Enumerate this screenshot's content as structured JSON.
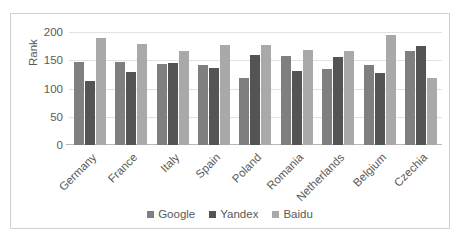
{
  "chart_data": {
    "type": "bar",
    "title": "",
    "subtitle": "",
    "xlabel": "",
    "ylabel": "Rank",
    "ylim": [
      0,
      200
    ],
    "yticks": [
      0,
      50,
      100,
      150,
      200
    ],
    "grid": true,
    "legend_position": "bottom",
    "categories": [
      "Germany",
      "France",
      "Italy",
      "Spain",
      "Poland",
      "Romania",
      "Netherlands",
      "Belgium",
      "Czechia"
    ],
    "series": [
      {
        "name": "Google",
        "color": "#7f7f7f",
        "values": [
          147,
          147,
          143,
          142,
          119,
          158,
          135,
          141,
          167
        ]
      },
      {
        "name": "Yandex",
        "color": "#545454",
        "values": [
          114,
          130,
          145,
          136,
          159,
          131,
          155,
          128,
          176
        ]
      },
      {
        "name": "Baidu",
        "color": "#a9a9a9",
        "values": [
          190,
          178,
          166,
          177,
          177,
          168,
          167,
          194,
          119
        ]
      }
    ]
  },
  "axis": {
    "y_title": "Rank",
    "y_tick_labels": [
      "200",
      "150",
      "100",
      "50",
      "0"
    ]
  },
  "legend": {
    "items": [
      {
        "label": "Google",
        "color": "#7f7f7f"
      },
      {
        "label": "Yandex",
        "color": "#545454"
      },
      {
        "label": "Baidu",
        "color": "#a9a9a9"
      }
    ]
  },
  "colors": {
    "gridline": "#e2e2e2",
    "axis": "#b8b8b8",
    "text": "#595959",
    "frame": "#d0d0d0",
    "background": "#ffffff"
  }
}
